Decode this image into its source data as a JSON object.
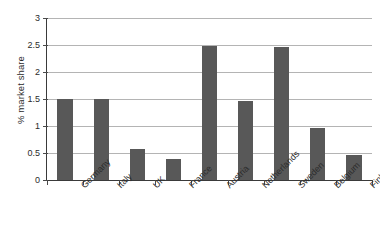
{
  "chart_data": {
    "type": "bar",
    "title": "",
    "subtitle": "",
    "xlabel": "",
    "ylabel": "% market share",
    "categories": [
      "Germany",
      "Italy",
      "UK",
      "France",
      "Austria",
      "Netherlands",
      "Sweden",
      "Belgium",
      "Finland"
    ],
    "values": [
      1.5,
      1.5,
      0.58,
      0.38,
      2.48,
      1.47,
      2.47,
      0.96,
      0.47
    ],
    "series": [
      {
        "name": "% market share",
        "values": [
          1.5,
          1.5,
          0.58,
          0.38,
          2.48,
          1.47,
          2.47,
          0.96,
          0.47
        ]
      }
    ],
    "ylim": [
      0,
      3
    ],
    "ytick_labels": [
      "0",
      "0.5",
      "1",
      "1.5",
      "2",
      "2.5",
      "3"
    ],
    "ytick_values": [
      0,
      0.5,
      1,
      1.5,
      2,
      2.5,
      3
    ],
    "grid": "horizontal",
    "legend": "none",
    "bar_color": "#585858",
    "gridline_color": "#b4b4b4",
    "axis_color": "#3a3a3a",
    "background_color": "#ffffff",
    "annotations": []
  }
}
